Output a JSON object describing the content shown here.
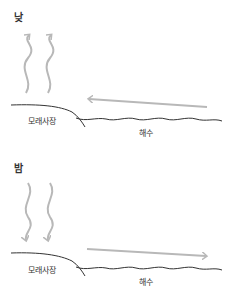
{
  "panels": {
    "day": {
      "title": "낮",
      "land_label": "모래사장",
      "sea_label": "해수"
    },
    "night": {
      "title": "밤",
      "land_label": "모래사장",
      "sea_label": "해수"
    }
  },
  "colors": {
    "arrow": "#b8b8b8",
    "line": "#333333"
  }
}
